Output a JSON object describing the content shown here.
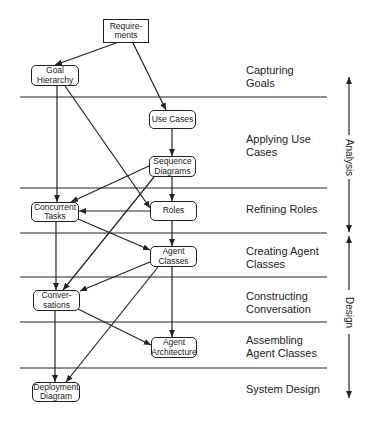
{
  "diagram": {
    "nodes": [
      {
        "id": "requirements",
        "label": "Require-\nments",
        "x": 103,
        "y": 19,
        "w": 46,
        "h": 24,
        "shape": "rect"
      },
      {
        "id": "goal_hierarchy",
        "label": "Goal\nHierarchy",
        "x": 31,
        "y": 65,
        "w": 48,
        "h": 21,
        "shape": "rounded"
      },
      {
        "id": "use_cases",
        "label": "Use Cases",
        "x": 149,
        "y": 110,
        "w": 47,
        "h": 19,
        "shape": "rounded"
      },
      {
        "id": "sequence_diagrams",
        "label": "Sequence\nDiagrams",
        "x": 149,
        "y": 156,
        "w": 47,
        "h": 21,
        "shape": "rounded"
      },
      {
        "id": "concurrent_tasks",
        "label": "Concurrent\nTasks",
        "x": 31,
        "y": 202,
        "w": 48,
        "h": 20,
        "shape": "rounded"
      },
      {
        "id": "roles",
        "label": "Roles",
        "x": 150,
        "y": 201,
        "w": 47,
        "h": 20,
        "shape": "rounded"
      },
      {
        "id": "agent_classes",
        "label": "Agent\nClasses",
        "x": 150,
        "y": 246,
        "w": 47,
        "h": 21,
        "shape": "rounded"
      },
      {
        "id": "conversations",
        "label": "Conver-\nsations",
        "x": 33,
        "y": 290,
        "w": 47,
        "h": 21,
        "shape": "rounded"
      },
      {
        "id": "agent_architecture",
        "label": "Agent\nArchitecture",
        "x": 151,
        "y": 337,
        "w": 46,
        "h": 21,
        "shape": "rounded"
      },
      {
        "id": "deployment_diagram",
        "label": "Deployment\nDiagram",
        "x": 32,
        "y": 382,
        "w": 48,
        "h": 20,
        "shape": "rounded"
      }
    ],
    "edges": [
      {
        "from": "requirements",
        "to": "goal_hierarchy",
        "x1": 116,
        "y1": 43,
        "x2": 55,
        "y2": 65
      },
      {
        "from": "requirements",
        "to": "use_cases",
        "x1": 133,
        "y1": 43,
        "x2": 166,
        "y2": 110
      },
      {
        "from": "goal_hierarchy",
        "to": "concurrent_tasks",
        "x1": 57,
        "y1": 86,
        "x2": 57,
        "y2": 202
      },
      {
        "from": "goal_hierarchy",
        "to": "roles",
        "x1": 65,
        "y1": 86,
        "x2": 150,
        "y2": 208
      },
      {
        "from": "use_cases",
        "to": "sequence_diagrams",
        "x1": 172,
        "y1": 129,
        "x2": 172,
        "y2": 156
      },
      {
        "from": "sequence_diagrams",
        "to": "concurrent_tasks",
        "x1": 149,
        "y1": 166,
        "x2": 71,
        "y2": 202
      },
      {
        "from": "sequence_diagrams",
        "to": "roles",
        "x1": 172,
        "y1": 177,
        "x2": 172,
        "y2": 201
      },
      {
        "from": "sequence_diagrams",
        "to": "conversations",
        "x1": 154,
        "y1": 177,
        "x2": 63,
        "y2": 290
      },
      {
        "from": "roles",
        "to": "concurrent_tasks",
        "x1": 150,
        "y1": 211,
        "x2": 79,
        "y2": 211
      },
      {
        "from": "roles",
        "to": "agent_classes",
        "x1": 172,
        "y1": 221,
        "x2": 172,
        "y2": 246
      },
      {
        "from": "concurrent_tasks",
        "to": "agent_classes",
        "x1": 78,
        "y1": 219,
        "x2": 150,
        "y2": 250
      },
      {
        "from": "concurrent_tasks",
        "to": "conversations",
        "x1": 56,
        "y1": 222,
        "x2": 56,
        "y2": 290
      },
      {
        "from": "agent_classes",
        "to": "conversations",
        "x1": 150,
        "y1": 262,
        "x2": 80,
        "y2": 291
      },
      {
        "from": "agent_classes",
        "to": "agent_architecture",
        "x1": 172,
        "y1": 267,
        "x2": 172,
        "y2": 337
      },
      {
        "from": "agent_classes",
        "to": "deployment_diagram",
        "x1": 158,
        "y1": 267,
        "x2": 66,
        "y2": 382
      },
      {
        "from": "conversations",
        "to": "agent_architecture",
        "x1": 78,
        "y1": 309,
        "x2": 151,
        "y2": 345
      },
      {
        "from": "conversations",
        "to": "deployment_diagram",
        "x1": 55,
        "y1": 311,
        "x2": 55,
        "y2": 382
      }
    ],
    "separators": [
      97,
      188,
      233,
      277,
      322,
      368
    ],
    "separator_x": [
      20,
      327
    ],
    "phases": [
      {
        "label": "Capturing\nGoals",
        "x": 246,
        "y": 64
      },
      {
        "label": "Applying Use\nCases",
        "x": 246,
        "y": 133
      },
      {
        "label": "Refining Roles",
        "x": 246,
        "y": 203
      },
      {
        "label": "Creating Agent\nClasses",
        "x": 246,
        "y": 245
      },
      {
        "label": "Constructing\nConversation",
        "x": 246,
        "y": 290
      },
      {
        "label": "Assembling\nAgent Classes",
        "x": 246,
        "y": 334
      },
      {
        "label": "System Design",
        "x": 246,
        "y": 383
      }
    ],
    "stages": [
      {
        "label": "Analysis",
        "x": 349,
        "top": 77,
        "bottom": 232,
        "text_center": 157
      },
      {
        "label": "Design",
        "x": 349,
        "top": 236,
        "bottom": 398,
        "text_center": 312
      }
    ],
    "colors": {
      "stroke": "#222222",
      "background": "#ffffff"
    }
  }
}
